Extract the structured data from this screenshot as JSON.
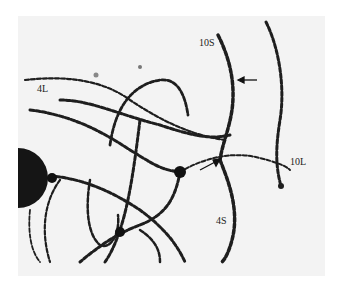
{
  "figure": {
    "labels": [
      {
        "text": "10S",
        "x": 199,
        "y": 42
      },
      {
        "text": "4L",
        "x": 37,
        "y": 88
      },
      {
        "text": "10L",
        "x": 290,
        "y": 160
      },
      {
        "text": "4S",
        "x": 216,
        "y": 220
      }
    ],
    "arrows": [
      {
        "name": "arrow-10S",
        "from": [
          257,
          80
        ],
        "to": [
          238,
          80
        ]
      },
      {
        "name": "arrow-junction",
        "from": [
          200,
          170
        ],
        "to": [
          220,
          160
        ]
      }
    ],
    "colors": {
      "background": "#f3f3f3",
      "chromosome": "#1e1e1e"
    }
  }
}
